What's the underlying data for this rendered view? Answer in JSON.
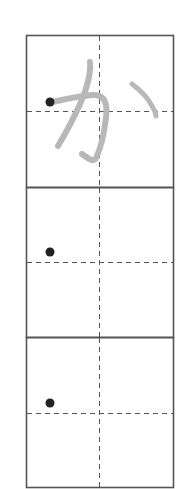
{
  "worksheet": {
    "character": "か",
    "reading": "ka",
    "boxes": [
      {
        "index": 0,
        "type": "trace-guide",
        "shows_character": true
      },
      {
        "index": 1,
        "type": "practice",
        "shows_character": false
      },
      {
        "index": 2,
        "type": "practice",
        "shows_character": false
      }
    ],
    "colors": {
      "border": "#555555",
      "guide_line": "#555555",
      "trace_stroke": "#b8b8b8",
      "start_dot": "#222222",
      "background": "#ffffff"
    }
  }
}
